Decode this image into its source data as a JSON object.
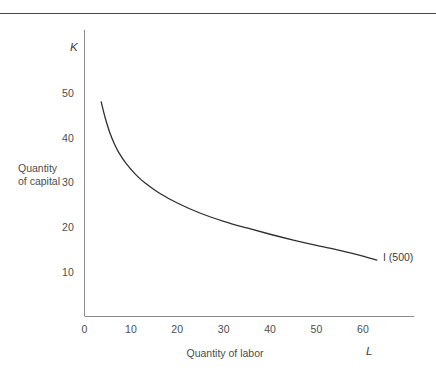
{
  "figure": {
    "background_color": "#ffffff",
    "rule_color": "#4a4a4a",
    "axis_color": "#8c8c8c",
    "curve_color": "#2f2f2f",
    "text_color": "#4d4d4d"
  },
  "chart_data": {
    "type": "line",
    "title": "",
    "subtitle": "",
    "xlabel": "Quantity of labor",
    "ylabel": "Quantity\nof capital",
    "x_axis_symbol": "L",
    "y_axis_symbol": "K",
    "xlim": [
      0,
      68
    ],
    "ylim": [
      0,
      58
    ],
    "xticks": [
      0,
      10,
      20,
      30,
      40,
      50,
      60
    ],
    "xticklabels": [
      "0",
      "10",
      "20",
      "30",
      "40",
      "50",
      "60"
    ],
    "yticks": [
      10,
      20,
      30,
      40,
      50
    ],
    "yticklabels": [
      "10",
      "20",
      "30",
      "40",
      "50"
    ],
    "grid": false,
    "legend_position": "inline-right",
    "series": [
      {
        "name": "I (500)",
        "label": "I (500)",
        "annotation": "I (500)",
        "x": [
          3.6,
          4.5,
          5.5,
          6.5,
          7.5,
          9,
          11,
          13,
          16,
          20,
          25,
          30,
          35,
          40,
          45,
          50,
          55,
          60,
          63
        ],
        "y": [
          48.0,
          44.3,
          41.0,
          38.5,
          36.5,
          34.2,
          31.8,
          29.9,
          27.7,
          25.4,
          23.1,
          21.3,
          19.8,
          18.4,
          17.1,
          15.9,
          14.8,
          13.5,
          12.6
        ]
      }
    ]
  },
  "labels": {
    "y_axis_symbol": "K",
    "x_axis_symbol": "L",
    "y_title_line1": "Quantity",
    "y_title_line2": "of capital",
    "x_title": "Quantity of labor",
    "curve_annotation": "I (500)"
  }
}
